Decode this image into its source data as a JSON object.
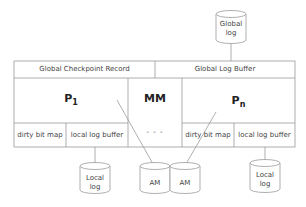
{
  "diagram": {
    "global_log": {
      "line1": "Global",
      "line2": "log"
    },
    "header": {
      "left": "Global Checkpoint Record",
      "right": "Global Log Buffer"
    },
    "processors": [
      {
        "name": "P",
        "subscript": "1",
        "cells": [
          "dirty bit map",
          "local log buffer"
        ]
      },
      {
        "name": "P",
        "subscript": "n",
        "cells": [
          "dirty bit map",
          "local log buffer"
        ]
      }
    ],
    "middle": {
      "label": "MM",
      "ellipsis": "- - -"
    },
    "local_logs": [
      {
        "line1": "Local",
        "line2": "log"
      },
      {
        "line1": "Local",
        "line2": "log"
      }
    ],
    "am_disks": [
      {
        "label": "AM"
      },
      {
        "label": "AM"
      }
    ],
    "colors": {
      "stroke": "#9a9a9a",
      "text": "#333333"
    }
  }
}
